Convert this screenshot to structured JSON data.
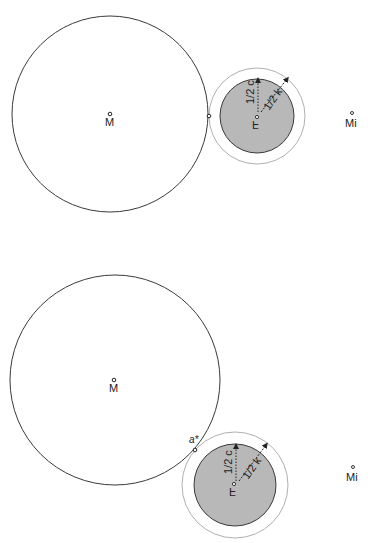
{
  "colors": {
    "stroke": "#3a3a3a",
    "fill_gray": "#b8b8b8",
    "outer_ring": "#9a9a9a",
    "background": "#ffffff"
  },
  "figures": [
    {
      "id": "top",
      "big_circle": {
        "cx": 110,
        "cy": 114,
        "r": 98,
        "center_label": "M"
      },
      "tangent_point": {
        "x": 209,
        "y": 116,
        "label": ""
      },
      "small_body": {
        "cx": 257,
        "cy": 116,
        "outer_r": 48,
        "inner_r": 37,
        "center_label": "F",
        "radius_inner_label": "1/2 c",
        "radius_outer_label": "1/2 k"
      },
      "far_point": {
        "x": 352,
        "y": 113,
        "label": "Mi"
      }
    },
    {
      "id": "bottom",
      "big_circle": {
        "cx": 115,
        "cy": 380,
        "r": 105,
        "center_label": "M"
      },
      "tangent_point": {
        "x": 195,
        "y": 450,
        "label": "a*"
      },
      "small_body": {
        "cx": 235,
        "cy": 485,
        "outer_r": 53,
        "inner_r": 41,
        "center_label": "F",
        "radius_inner_label": "1/2 c",
        "radius_outer_label": "1/2 k"
      },
      "far_point": {
        "x": 353,
        "y": 467,
        "label": "Mi"
      }
    }
  ]
}
